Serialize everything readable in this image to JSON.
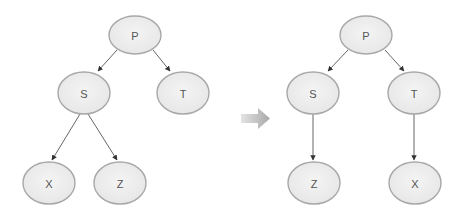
{
  "diagram": {
    "before": {
      "nodes": [
        {
          "id": "P",
          "label": "P",
          "cx": 135,
          "cy": 35
        },
        {
          "id": "S",
          "label": "S",
          "cx": 84,
          "cy": 93
        },
        {
          "id": "T",
          "label": "T",
          "cx": 183,
          "cy": 93
        },
        {
          "id": "X",
          "label": "X",
          "cx": 49,
          "cy": 183
        },
        {
          "id": "Z",
          "label": "Z",
          "cx": 120,
          "cy": 183
        }
      ],
      "edges": [
        {
          "from": "P",
          "to": "S"
        },
        {
          "from": "P",
          "to": "T"
        },
        {
          "from": "S",
          "to": "X"
        },
        {
          "from": "S",
          "to": "Z"
        }
      ]
    },
    "transition_arrow": {
      "icon": "right-arrow-icon",
      "color": "#b8b8b8"
    },
    "after": {
      "nodes": [
        {
          "id": "P",
          "label": "P",
          "cx": 366,
          "cy": 35
        },
        {
          "id": "S",
          "label": "S",
          "cx": 313,
          "cy": 93
        },
        {
          "id": "T",
          "label": "T",
          "cx": 414,
          "cy": 93
        },
        {
          "id": "Z",
          "label": "Z",
          "cx": 314,
          "cy": 183
        },
        {
          "id": "X",
          "label": "X",
          "cx": 415,
          "cy": 183
        }
      ],
      "edges": [
        {
          "from": "P",
          "to": "S"
        },
        {
          "from": "P",
          "to": "T"
        },
        {
          "from": "S",
          "to": "Z"
        },
        {
          "from": "T",
          "to": "X"
        }
      ]
    },
    "colors": {
      "node_fill": "#eeeeee",
      "node_stroke": "#a8a8a8",
      "edge": "#555555",
      "label": "#555555"
    }
  }
}
